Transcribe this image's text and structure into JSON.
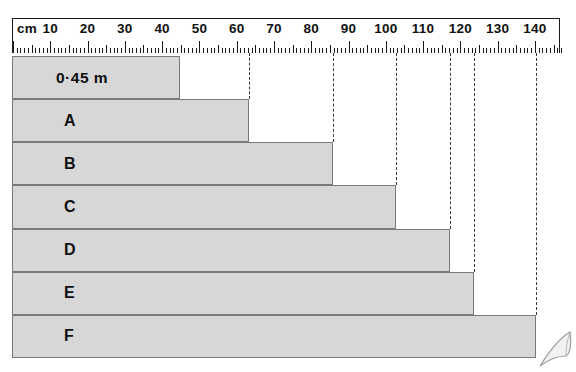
{
  "ruler": {
    "unit_label": "cm",
    "tick_labels": [
      "10",
      "20",
      "30",
      "40",
      "50",
      "60",
      "70",
      "80",
      "90",
      "100",
      "110",
      "120",
      "130",
      "140"
    ],
    "tick_values": [
      10,
      20,
      30,
      40,
      50,
      60,
      70,
      80,
      90,
      100,
      110,
      120,
      130,
      140
    ],
    "min_cm": 0,
    "max_cm": 147,
    "minor_step_cm": 1,
    "mid_step_cm": 5,
    "major_step_cm": 10
  },
  "chart_data": {
    "type": "bar",
    "title": "",
    "xlabel": "cm",
    "ylabel": "",
    "orientation": "horizontal",
    "xlim": [
      0,
      147
    ],
    "grid": false,
    "legend": null,
    "categories": [
      "0·45 m",
      "A",
      "B",
      "C",
      "D",
      "E",
      "F"
    ],
    "values": [
      45,
      63.5,
      86,
      103,
      117.5,
      124,
      140.5
    ],
    "value_unit": "cm",
    "dashed_guides_cm": [
      63.5,
      86,
      103,
      117.5,
      124,
      140.5
    ]
  },
  "bars": [
    {
      "label": "0·45 m",
      "length_cm": 45,
      "name": "bar-045m"
    },
    {
      "label": "A",
      "length_cm": 63.5,
      "name": "bar-a"
    },
    {
      "label": "B",
      "length_cm": 86,
      "name": "bar-b"
    },
    {
      "label": "C",
      "length_cm": 103,
      "name": "bar-c"
    },
    {
      "label": "D",
      "length_cm": 117.5,
      "name": "bar-d"
    },
    {
      "label": "E",
      "length_cm": 124,
      "name": "bar-e"
    },
    {
      "label": "F",
      "length_cm": 140.5,
      "name": "bar-f"
    }
  ],
  "colors": {
    "bar_fill": "#d7d7d7",
    "bar_border": "#7a7a7a",
    "ruler_line": "#1c1c1c",
    "guide_line": "#3a3a3a",
    "text": "#101010",
    "background": "#ffffff"
  }
}
